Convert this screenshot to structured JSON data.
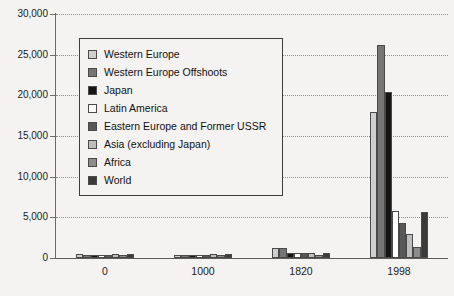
{
  "chart_data": {
    "type": "bar",
    "title": "",
    "subtitle": "",
    "xlabel": "",
    "ylabel": "",
    "categories": [
      "0",
      "1000",
      "1820",
      "1998"
    ],
    "ylim": [
      0,
      30000
    ],
    "yticks": [
      0,
      5000,
      10000,
      15000,
      20000,
      25000,
      30000
    ],
    "ytick_labels": [
      "0",
      "5,000",
      "10,000",
      "15,000",
      "20,000",
      "25,000",
      "30,000"
    ],
    "grid": true,
    "legend_position": "upper-left-inside",
    "series": [
      {
        "name": "Western Europe",
        "color": "#cfcfcf",
        "values": [
          450,
          400,
          1232,
          17921
        ]
      },
      {
        "name": "Western Europe Offshoots",
        "color": "#767676",
        "values": [
          400,
          400,
          1201,
          26146
        ]
      },
      {
        "name": "Japan",
        "color": "#151515",
        "values": [
          400,
          425,
          669,
          20413
        ]
      },
      {
        "name": "Latin America",
        "color": "#ffffff",
        "values": [
          400,
          400,
          665,
          5795
        ]
      },
      {
        "name": "Eastern Europe and Former USSR",
        "color": "#585858",
        "values": [
          400,
          400,
          667,
          4354
        ]
      },
      {
        "name": "Asia (excluding Japan)",
        "color": "#bdbdbd",
        "values": [
          450,
          450,
          575,
          2936
        ]
      },
      {
        "name": "Africa",
        "color": "#8c8c8c",
        "values": [
          425,
          416,
          418,
          1368
        ]
      },
      {
        "name": "World",
        "color": "#3a3a3a",
        "values": [
          444,
          435,
          667,
          5709
        ]
      }
    ]
  },
  "legend": {
    "items": [
      {
        "label": "Western Europe"
      },
      {
        "label": "Western Europe Offshoots"
      },
      {
        "label": "Japan"
      },
      {
        "label": "Latin America"
      },
      {
        "label": "Eastern Europe and Former USSR"
      },
      {
        "label": "Asia (excluding Japan)"
      },
      {
        "label": "Africa"
      },
      {
        "label": "World"
      }
    ]
  }
}
